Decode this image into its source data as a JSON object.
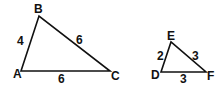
{
  "diagram": {
    "stroke_color": "#111111",
    "triangles": [
      {
        "name": "ABC",
        "vertices": [
          {
            "label": "A",
            "x": 21,
            "y": 71,
            "lx": 13,
            "ly": 78
          },
          {
            "label": "B",
            "x": 39,
            "y": 16,
            "lx": 34,
            "ly": 13
          },
          {
            "label": "C",
            "x": 110,
            "y": 71,
            "lx": 111,
            "ly": 80
          }
        ],
        "sides": [
          {
            "side": "AB",
            "length": "4",
            "lx": 17,
            "ly": 45
          },
          {
            "side": "BC",
            "length": "6",
            "lx": 76,
            "ly": 44
          },
          {
            "side": "AC",
            "length": "6",
            "lx": 58,
            "ly": 83
          }
        ]
      },
      {
        "name": "DEF",
        "vertices": [
          {
            "label": "D",
            "x": 161,
            "y": 72,
            "lx": 151,
            "ly": 79
          },
          {
            "label": "E",
            "x": 171,
            "y": 42,
            "lx": 167,
            "ly": 40
          },
          {
            "label": "F",
            "x": 206,
            "y": 72,
            "lx": 207,
            "ly": 80
          }
        ],
        "sides": [
          {
            "side": "DE",
            "length": "2",
            "lx": 157,
            "ly": 60
          },
          {
            "side": "EF",
            "length": "3",
            "lx": 192,
            "ly": 60
          },
          {
            "side": "DF",
            "length": "3",
            "lx": 180,
            "ly": 83
          }
        ]
      }
    ]
  }
}
